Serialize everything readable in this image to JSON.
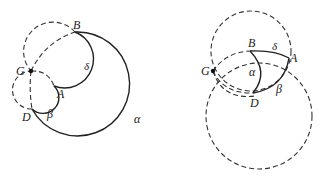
{
  "figures": [
    {
      "name": "left-figure",
      "points": {
        "G": "G",
        "B": "B",
        "A": "A",
        "D": "D"
      },
      "arcs": {
        "alpha": "α",
        "beta": "β",
        "delta": "δ"
      }
    },
    {
      "name": "right-figure",
      "points": {
        "G": "G",
        "B": "B",
        "A": "A",
        "D": "D"
      },
      "arcs": {
        "alpha": "α",
        "beta": "β",
        "delta": "δ"
      }
    }
  ]
}
